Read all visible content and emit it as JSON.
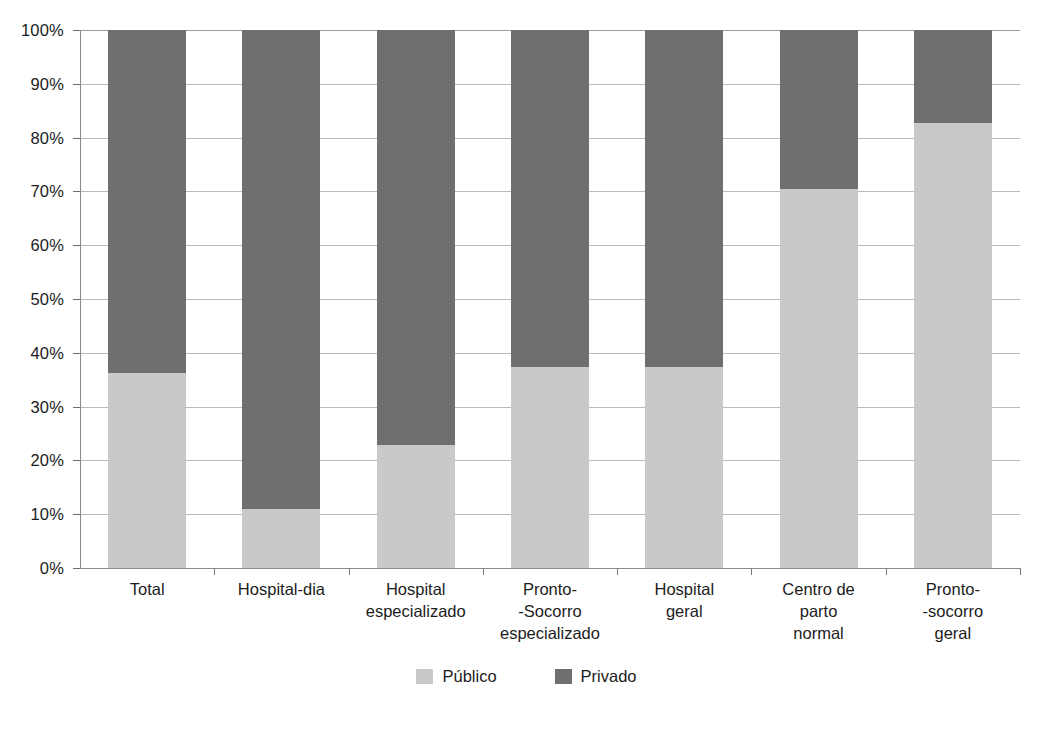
{
  "chart_data": {
    "type": "bar",
    "subtype": "100% stacked bar",
    "title": "",
    "subtitle": "",
    "xlabel": "",
    "ylabel": "",
    "ylim": [
      0,
      100
    ],
    "y_tick_labels": [
      "100%",
      "90%",
      "80%",
      "70%",
      "60%",
      "50%",
      "40%",
      "30%",
      "20%",
      "10%",
      "0%"
    ],
    "y_tick_values": [
      100,
      90,
      80,
      70,
      60,
      50,
      40,
      30,
      20,
      10,
      0
    ],
    "grid": true,
    "legend_position": "bottom-center",
    "categories": [
      "Total",
      "Hospital-dia",
      "Hospital\nespecializado",
      "Pronto-\n-Socorro\nespecializado",
      "Hospital\ngeral",
      "Centro de\nparto\nnormal",
      "Pronto-\n-socorro\ngeral"
    ],
    "series": [
      {
        "name": "Público",
        "color": "#c9c9c9",
        "values": [
          36.3,
          11.0,
          22.8,
          37.3,
          37.3,
          70.5,
          82.8
        ]
      },
      {
        "name": "Privado",
        "color": "#6f6f6f",
        "values": [
          63.7,
          89.0,
          77.2,
          62.7,
          62.7,
          29.5,
          17.2
        ]
      }
    ]
  },
  "legend": {
    "items": [
      {
        "label": "Público",
        "color": "#c9c9c9"
      },
      {
        "label": "Privado",
        "color": "#6f6f6f"
      }
    ]
  },
  "colors": {
    "publico": "#c9c9c9",
    "privado": "#6f6f6f",
    "gridline": "#b9b9b9",
    "axis": "#8a8a8a",
    "background": "#ffffff",
    "text": "#1c1c1c"
  }
}
